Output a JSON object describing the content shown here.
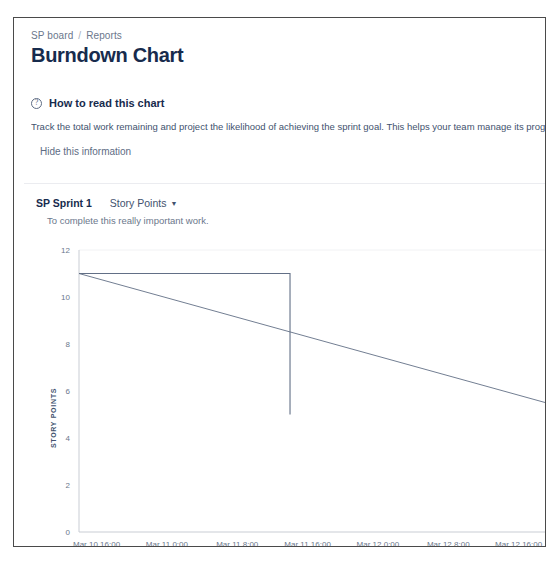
{
  "breadcrumb": {
    "board": "SP board",
    "separator": "/",
    "current": "Reports"
  },
  "page_title": "Burndown Chart",
  "info_panel": {
    "icon": "help-circle-icon",
    "icon_glyph": "?",
    "heading": "How to read this chart",
    "description": "Track the total work remaining and project the likelihood of achieving the sprint goal. This helps your team manage its progress",
    "hide_link": "Hide this information"
  },
  "sprint": {
    "name": "SP Sprint 1",
    "metric_selected": "Story Points",
    "metric_caret": "▼",
    "subtitle": "To complete this really important work."
  },
  "chart_data": {
    "type": "line",
    "title": "Burndown Chart",
    "xlabel": "TIME",
    "ylabel": "STORY POINTS",
    "ylim": [
      0,
      12
    ],
    "yticks": [
      0,
      2,
      4,
      6,
      8,
      10,
      12
    ],
    "ytick_labels": [
      "0",
      "2",
      "4",
      "6",
      "8",
      "10",
      "12"
    ],
    "grid": true,
    "legend": "none",
    "xticks": [
      0,
      8,
      16,
      24,
      32,
      40,
      48
    ],
    "xtick_labels": [
      "Mar 10 16:00",
      "Mar 11 0:00",
      "Mar 11 8:00",
      "Mar 11 16:00",
      "Mar 12 0:00",
      "Mar 12 8:00",
      "Mar 12 16:00"
    ],
    "xlim": [
      -2,
      51
    ],
    "series": [
      {
        "name": "Remaining work",
        "color": "#626f86",
        "type": "step",
        "x": [
          -2,
          22,
          22,
          22
        ],
        "values": [
          11,
          11,
          11,
          5
        ]
      },
      {
        "name": "Guideline",
        "color": "#626f86",
        "type": "line",
        "x": [
          -2,
          54
        ],
        "values": [
          11,
          5.2
        ]
      }
    ]
  }
}
